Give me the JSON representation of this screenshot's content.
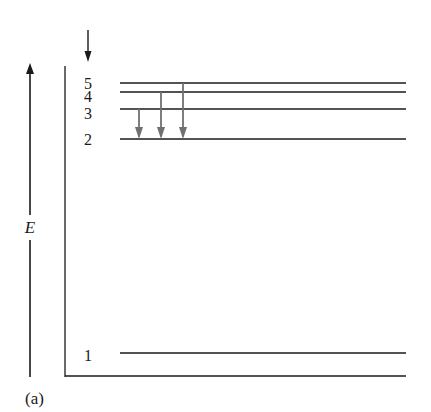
{
  "figure": {
    "panel_label": "(a)",
    "axis_label": "E",
    "colors": {
      "line": "#1a1a1a",
      "transition_arrow": "#707070"
    },
    "levels": [
      {
        "n": "5",
        "y": 83
      },
      {
        "n": "4",
        "y": 92
      },
      {
        "n": "3",
        "y": 109
      },
      {
        "n": "2",
        "y": 139
      },
      {
        "n": "1",
        "y": 353
      }
    ],
    "transitions": [
      {
        "from": "3",
        "to": "2",
        "x": 139
      },
      {
        "from": "4",
        "to": "2",
        "x": 161
      },
      {
        "from": "5",
        "to": "2",
        "x": 183
      }
    ],
    "incoming_arrow": "downward arrow above level 5"
  }
}
